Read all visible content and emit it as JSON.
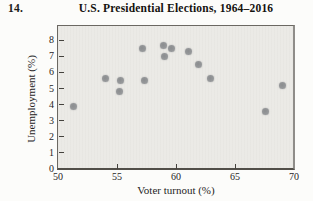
{
  "page": {
    "exercise_number": "14."
  },
  "chart_data": {
    "type": "scatter",
    "title": "U.S. Presidential Elections, 1964–2016",
    "xlabel": "Voter turnout (%)",
    "ylabel": "Unemployment (%)",
    "xlim": [
      50,
      70
    ],
    "ylim": [
      0,
      8.9
    ],
    "x_ticks": [
      50,
      55,
      60,
      65,
      70
    ],
    "y_ticks": [
      0,
      1,
      2,
      3,
      4,
      5,
      6,
      7,
      8
    ],
    "grid": false,
    "legend": "none",
    "points": [
      {
        "x": 51.3,
        "y": 3.9
      },
      {
        "x": 54.0,
        "y": 5.6
      },
      {
        "x": 55.3,
        "y": 5.5
      },
      {
        "x": 55.2,
        "y": 4.8
      },
      {
        "x": 57.2,
        "y": 7.5
      },
      {
        "x": 57.3,
        "y": 5.5
      },
      {
        "x": 58.9,
        "y": 7.7
      },
      {
        "x": 59.0,
        "y": 7.0
      },
      {
        "x": 59.6,
        "y": 7.5
      },
      {
        "x": 61.1,
        "y": 7.3
      },
      {
        "x": 61.9,
        "y": 6.5
      },
      {
        "x": 62.9,
        "y": 5.6
      },
      {
        "x": 67.6,
        "y": 3.6
      },
      {
        "x": 69.0,
        "y": 5.2
      }
    ],
    "colors": {
      "point": "#97999b",
      "plot_bg": "#ebeae6",
      "border": "#6b6862",
      "tick": "#44423d",
      "text": "#26241f"
    }
  }
}
